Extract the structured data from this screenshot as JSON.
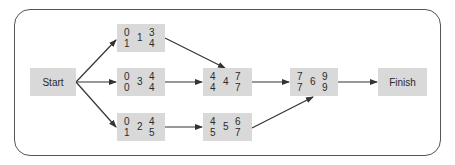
{
  "diagram": {
    "type": "network-diagram",
    "start": {
      "label": "Start"
    },
    "finish": {
      "label": "Finish"
    },
    "activities": [
      {
        "id": "1",
        "es": "0",
        "ef": "3",
        "ls": "1",
        "lf": "4"
      },
      {
        "id": "3",
        "es": "0",
        "ef": "4",
        "ls": "0",
        "lf": "4"
      },
      {
        "id": "2",
        "es": "0",
        "ef": "4",
        "ls": "1",
        "lf": "5"
      },
      {
        "id": "4",
        "es": "4",
        "ef": "7",
        "ls": "4",
        "lf": "7"
      },
      {
        "id": "5",
        "es": "4",
        "ef": "6",
        "ls": "5",
        "lf": "7"
      },
      {
        "id": "6",
        "es": "7",
        "ef": "9",
        "ls": "7",
        "lf": "9"
      }
    ],
    "edges": [
      {
        "from": "Start",
        "to": "1"
      },
      {
        "from": "Start",
        "to": "3"
      },
      {
        "from": "Start",
        "to": "2"
      },
      {
        "from": "1",
        "to": "4"
      },
      {
        "from": "3",
        "to": "4"
      },
      {
        "from": "2",
        "to": "5"
      },
      {
        "from": "4",
        "to": "6"
      },
      {
        "from": "5",
        "to": "6"
      },
      {
        "from": "6",
        "to": "Finish"
      }
    ],
    "colors": {
      "node_fill": "#d9d9d9",
      "line": "#333333",
      "frame": "#555555"
    }
  }
}
